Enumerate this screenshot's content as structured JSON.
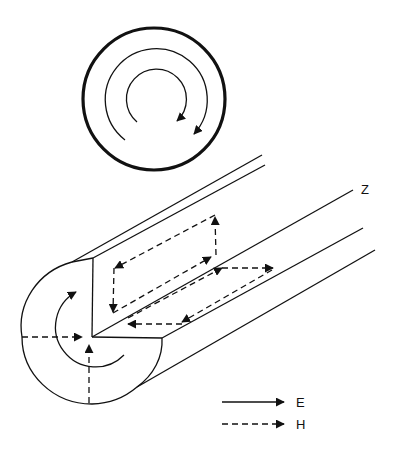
{
  "figure": {
    "axis_label": "Z",
    "legend": [
      {
        "symbol": "solid-arrow",
        "label": "E"
      },
      {
        "symbol": "dashed-arrow",
        "label": "H"
      }
    ],
    "colors": {
      "line": "#111111",
      "background": "#ffffff"
    }
  }
}
